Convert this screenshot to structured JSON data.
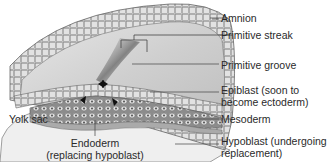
{
  "diagram": {
    "type": "anatomical-illustration",
    "labels": {
      "amnion": "Amnion",
      "primitive_streak": "Primitive streak",
      "primitive_groove": "Primitive groove",
      "epiblast_line1": "Epiblast (soon to",
      "epiblast_line2": "become ectoderm)",
      "mesoderm": "Mesoderm",
      "hypoblast_line1": "Hypoblast (undergoing",
      "hypoblast_line2": "replacement)",
      "yolk_sac": "Yolk sac",
      "endoderm_line1": "Endoderm",
      "endoderm_line2": "(replacing hypoblast)"
    },
    "colors": {
      "tissue_light": "#d9d9d9",
      "tissue_mid": "#b8b8b8",
      "tissue_dark": "#7a7a7a",
      "outline": "#555555",
      "leader_line": "#444444",
      "text": "#2a2a2a"
    }
  }
}
